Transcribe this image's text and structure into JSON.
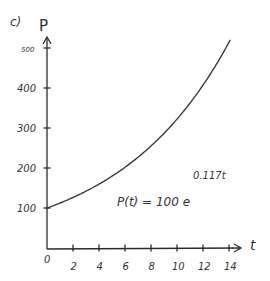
{
  "panel_label": "c)",
  "chart_data": {
    "type": "line",
    "title": "",
    "panel": "c)",
    "xlabel": "t",
    "ylabel": "P",
    "xlim": [
      0,
      14
    ],
    "ylim": [
      0,
      500
    ],
    "grid": false,
    "legend": null,
    "x_ticks": [
      0,
      2,
      4,
      6,
      8,
      10,
      12,
      14
    ],
    "x_tick_labels": [
      "0",
      "2",
      "4",
      "6",
      "8",
      "10",
      "12",
      "14"
    ],
    "y_ticks": [
      100,
      200,
      300,
      400,
      500
    ],
    "y_tick_labels": [
      "100",
      "200",
      "300",
      "400",
      "500"
    ],
    "annotation": {
      "text": "P(t) = 100 e",
      "exponent": "0.117t"
    },
    "function": "P(t) = 100 * exp(0.117 * t)",
    "series": [
      {
        "name": "P(t)",
        "x": [
          0,
          2,
          4,
          6,
          8,
          10,
          12,
          14
        ],
        "values": [
          100,
          126,
          160,
          202,
          255,
          322,
          407,
          514
        ]
      }
    ],
    "color": "#3a3a3a"
  }
}
